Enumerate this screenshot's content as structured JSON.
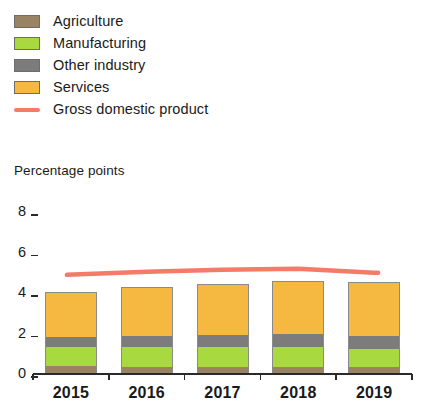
{
  "legend": {
    "items": [
      {
        "label": "Agriculture",
        "color": "#9a8363",
        "type": "swatch",
        "icon": "square-swatch-icon"
      },
      {
        "label": "Manufacturing",
        "color": "#a8d93f",
        "type": "swatch",
        "icon": "square-swatch-icon"
      },
      {
        "label": "Other industry",
        "color": "#7c7c7c",
        "type": "swatch",
        "icon": "square-swatch-icon"
      },
      {
        "label": "Services",
        "color": "#f5b942",
        "type": "swatch",
        "icon": "square-swatch-icon"
      },
      {
        "label": "Gross domestic product",
        "color": "#f47b68",
        "type": "line",
        "icon": "line-swatch-icon"
      }
    ]
  },
  "axis": {
    "y_title": "Percentage points",
    "y_ticks": [
      "8",
      "6",
      "4",
      "2",
      "0"
    ],
    "x_ticks": [
      "2015",
      "2016",
      "2017",
      "2018",
      "2019"
    ]
  },
  "chart_data": {
    "type": "bar",
    "title": "Percentage points",
    "xlabel": "",
    "ylabel": "Percentage points",
    "ylim": [
      0,
      8
    ],
    "yticks": [
      0,
      2,
      4,
      6,
      8
    ],
    "grid": false,
    "legend_position": "top-left",
    "stacked": true,
    "categories": [
      "2015",
      "2016",
      "2017",
      "2018",
      "2019"
    ],
    "series": [
      {
        "name": "Agriculture",
        "color": "#9a8363",
        "values": [
          0.35,
          0.3,
          0.3,
          0.3,
          0.3
        ]
      },
      {
        "name": "Manufacturing",
        "color": "#a8d93f",
        "values": [
          0.95,
          1.0,
          1.0,
          1.0,
          0.9
        ]
      },
      {
        "name": "Other industry",
        "color": "#7c7c7c",
        "values": [
          0.5,
          0.55,
          0.6,
          0.65,
          0.65
        ]
      },
      {
        "name": "Services",
        "color": "#f5b942",
        "values": [
          2.2,
          2.4,
          2.5,
          2.6,
          2.65
        ]
      }
    ],
    "overlay_series": [
      {
        "name": "Gross domestic product",
        "type": "line",
        "color": "#f47b68",
        "x": [
          "2015",
          "2016",
          "2017",
          "2018",
          "2019"
        ],
        "values": [
          4.85,
          5.0,
          5.1,
          5.15,
          4.95
        ]
      }
    ]
  }
}
